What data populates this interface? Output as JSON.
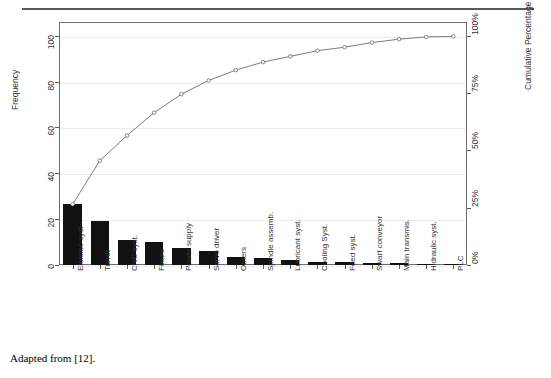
{
  "figure": {
    "caption": "Adapted from [12].",
    "top_rule": "horizontal-rule"
  },
  "chart_data": {
    "type": "bar",
    "title": "",
    "subtitle": "",
    "xlabel": "",
    "ylabel": "Frequency",
    "y2label": "Cumulative Percentage",
    "grid": true,
    "legend": "none",
    "ylim": [
      0,
      106
    ],
    "y2lim": [
      0,
      106
    ],
    "yticks": [
      "0",
      "20",
      "40",
      "60",
      "80",
      "100"
    ],
    "ytick_values": [
      0,
      20,
      40,
      60,
      80,
      100
    ],
    "y2ticks": [
      "0%",
      "25%",
      "50%",
      "75%",
      "100%"
    ],
    "y2tick_values": [
      0,
      25,
      50,
      75,
      100
    ],
    "categories": [
      "Elelelec syst",
      "Turret",
      "CNC syst.",
      "Fixure",
      "Power supply",
      "Servo driver",
      "Others",
      "Spindle assemb.",
      "Lubricant syst.",
      "Cooling Syst.",
      "Feed syst.",
      "Swarf conveyor",
      "Main transmis.",
      "Hidraulic syst.",
      "PLC"
    ],
    "values": [
      26.5,
      19,
      11,
      10,
      7.5,
      6,
      3.5,
      3,
      2,
      1.2,
      1.1,
      1,
      0.8,
      0.5,
      0.2
    ],
    "cumulative_percent": [
      26.5,
      45.5,
      56.5,
      66.5,
      74,
      80,
      83.5,
      86.5,
      88.5,
      89.7,
      90.8,
      91.8,
      92.6,
      93.1,
      93.3
    ],
    "cumulative_plot": [
      26.5,
      45.5,
      56.5,
      66.5,
      74.5,
      80.5,
      85.0,
      88.5,
      91.0,
      93.5,
      95.0,
      97.0,
      98.5,
      99.5,
      99.7
    ],
    "bar_color": "#111111",
    "line_color": "#5a5a5a",
    "marker": "open-circle",
    "grid_color": "#ededed"
  }
}
